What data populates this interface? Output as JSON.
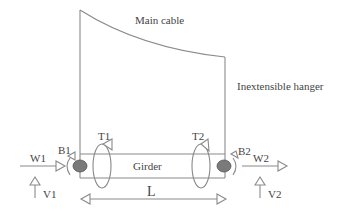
{
  "diagram": {
    "labels": {
      "main_cable": "Main cable",
      "hanger": "Inextensible hanger",
      "girder": "Girder",
      "length": "L",
      "w1": "W1",
      "w2": "W2",
      "v1": "V1",
      "v2": "V2",
      "b1": "B1",
      "b2": "B2",
      "t1": "T1",
      "t2": "T2"
    },
    "colors": {
      "line": "#8a8a8a",
      "text": "#444444",
      "support_fill": "#7a7a7a"
    }
  }
}
